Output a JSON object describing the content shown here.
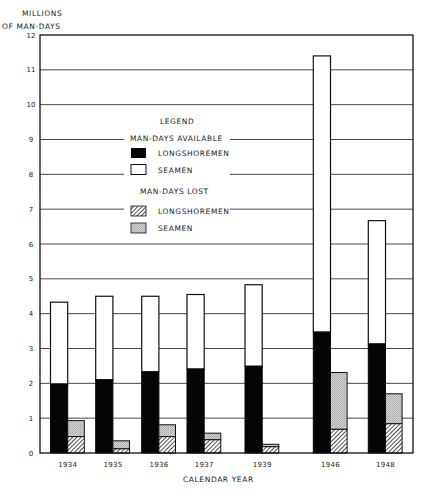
{
  "chart_data": {
    "type": "bar",
    "title": "",
    "ylabel": "MILLIONS OF MAN-DAYS",
    "ylabel_lines": [
      "MILLIONS",
      "OF  MAN-DAYS"
    ],
    "xlabel": "CALENDAR  YEAR",
    "ylim": [
      0,
      12
    ],
    "yticks": [
      0,
      1,
      2,
      3,
      4,
      5,
      6,
      7,
      8,
      9,
      10,
      11,
      12
    ],
    "grid": true,
    "categories": [
      "1934",
      "1935",
      "1936",
      "1937",
      "1939",
      "1946",
      "1948"
    ],
    "stacking": "Each year has two stacked bars: Man-Days Available (Longshoremen bottom + Seamen top) and Man-Days Lost (Longshoremen bottom + Seamen top). Values are stacked segment sizes.",
    "series": [
      {
        "name": "Man-Days Available - Longshoremen",
        "group": "available",
        "pattern": "solid-black",
        "values": [
          1.98,
          2.1,
          2.33,
          2.41,
          2.49,
          3.47,
          3.13
        ]
      },
      {
        "name": "Man-Days Available - Seamen",
        "group": "available",
        "pattern": "white",
        "values": [
          2.35,
          2.4,
          2.17,
          2.14,
          2.34,
          7.93,
          3.54
        ]
      },
      {
        "name": "Man-Days Lost - Longshoremen",
        "group": "lost",
        "pattern": "diagonal-hatch",
        "values": [
          0.47,
          0.12,
          0.47,
          0.38,
          0.18,
          0.68,
          0.84
        ]
      },
      {
        "name": "Man-Days Lost - Seamen",
        "group": "lost",
        "pattern": "light-gray-stipple",
        "values": [
          0.46,
          0.23,
          0.34,
          0.19,
          0.07,
          1.63,
          0.86
        ]
      }
    ],
    "totals": {
      "available": [
        4.33,
        4.5,
        4.5,
        4.55,
        4.83,
        11.4,
        6.67
      ],
      "lost": [
        0.93,
        0.35,
        0.81,
        0.57,
        0.25,
        2.31,
        1.7
      ]
    },
    "legend": {
      "title": "LEGEND",
      "position": "upper-left inside plot",
      "groups": [
        {
          "heading": "MAN-DAYS  AVAILABLE",
          "items": [
            {
              "label": "LONGSHOREMEN",
              "swatch": "solid-black"
            },
            {
              "label": "SEAMEN",
              "swatch": "white"
            }
          ]
        },
        {
          "heading": "MAN-DAYS  LOST",
          "items": [
            {
              "label": "LONGSHOREMEN",
              "swatch": "diagonal-hatch"
            },
            {
              "label": "SEAMEN",
              "swatch": "light-gray-stipple"
            }
          ]
        }
      ]
    }
  },
  "colors": {
    "axis": "#111111",
    "grid": "#333333",
    "black_fill": "#050505",
    "white_fill": "#ffffff",
    "gray_fill": "#c8c8c8",
    "hatch": "#222222"
  }
}
